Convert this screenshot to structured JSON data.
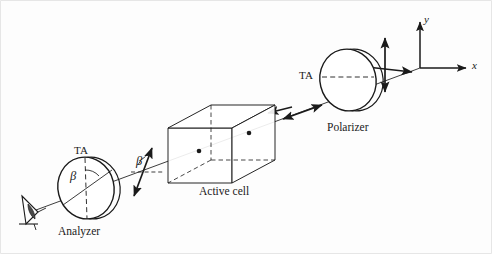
{
  "figure": {
    "background_color": "#fdfdfd",
    "line_color": "#1a1a1a",
    "hidden_edge_style": "dashed"
  },
  "components": {
    "polarizer": {
      "label": "Polarizer",
      "transmission_axis_label": "TA",
      "transmission_axis_orientation": "horizontal"
    },
    "active_cell": {
      "label": "Active cell",
      "shape": "rectangular-box",
      "marker_count": 2
    },
    "analyzer": {
      "label": "Analyzer",
      "transmission_axis_label": "TA",
      "transmission_axis_orientation": "vertical"
    },
    "observer": {
      "label": "eye"
    }
  },
  "angles": {
    "analyzer_beta": "β",
    "beam_beta": "β"
  },
  "axes": {
    "x_label": "x",
    "y_label": "y"
  },
  "annotations": {
    "incident_light": "unpolarized-cross-arrows",
    "polarized_light": "double-headed-arrow",
    "propagation": "left-arrow",
    "rotated_polarization": "tilted-double-headed-arrow"
  }
}
